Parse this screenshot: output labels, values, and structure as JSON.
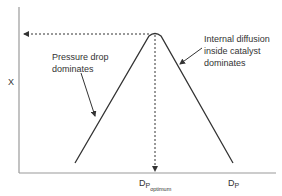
{
  "diagram": {
    "y_axis_label": "X",
    "x_axis_label_main": "D",
    "x_axis_label_sub": "P",
    "optimum_label_main": "D",
    "optimum_label_sub": "P",
    "optimum_label_subsub": "optimum",
    "left_annotation_line1": "Pressure drop",
    "left_annotation_line2": "dominates",
    "right_annotation_line1": "Internal diffusion",
    "right_annotation_line2": "inside catalyst",
    "right_annotation_line3": "dominates",
    "colors": {
      "axis": "#9a9a9a",
      "curve": "#333333",
      "text": "#333333"
    }
  }
}
